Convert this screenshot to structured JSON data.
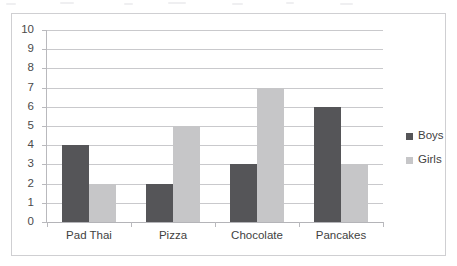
{
  "chart_data": {
    "type": "bar",
    "title": "",
    "subtitle": "",
    "xlabel": "",
    "ylabel": "",
    "categories": [
      "Pad Thai",
      "Pizza",
      "Chocolate",
      "Pancakes"
    ],
    "series": [
      {
        "name": "Boys",
        "color": "#555558",
        "values": [
          4,
          2,
          3,
          6
        ]
      },
      {
        "name": "Girls",
        "color": "#c6c6c8",
        "values": [
          2,
          5,
          7,
          3
        ]
      }
    ],
    "ylim": [
      0,
      10
    ],
    "ytick_step": 1,
    "ytick_labels": [
      "10",
      "9",
      "8",
      "7",
      "6",
      "5",
      "4",
      "3",
      "2",
      "1",
      "0"
    ],
    "grid": true,
    "grid_axis": "y",
    "legend_position": "right",
    "frame": true,
    "bar_grouping": "clustered",
    "annotations": []
  },
  "legend": {
    "items": [
      {
        "label": "Boys"
      },
      {
        "label": "Girls"
      }
    ]
  }
}
